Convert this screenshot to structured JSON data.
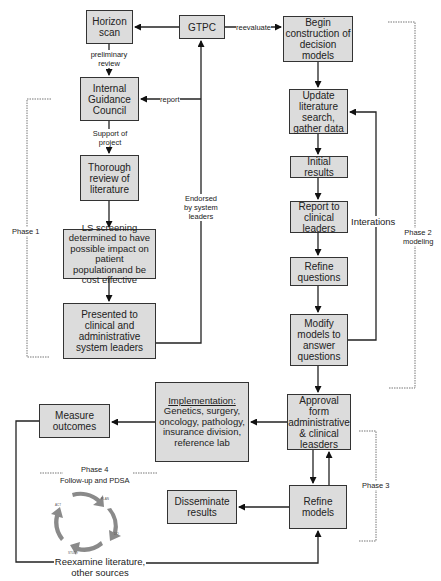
{
  "diagram": {
    "boxes": {
      "horizon_scan": "Horizon scan",
      "gtpc": "GTPC",
      "begin_construction": "Begin construction of decision models",
      "internal_guidance": "Internal Guidance Council",
      "thorough_review": "Thorough review of literature",
      "ls_screening": "LS screening determined to have possible impact on patient populationand be cost effective",
      "presented": "Presented to clinical and administrative system leaders",
      "update_literature": "Update literature search, gather data",
      "initial_results": "Initial results",
      "report_clinical": "Report to clinical leaders",
      "refine_questions": "Refine questions",
      "modify_models": "Modify models to answer questions",
      "approval": "Approval form administrative & clinical leasders",
      "implementation_title": "Implementation:",
      "implementation_body": "Genetics, surgery, oncology, pathology, insurance division, reference lab",
      "measure_outcomes": "Measure outcomes",
      "disseminate": "Disseminate results",
      "refine_models": "Refine models"
    },
    "edge_labels": {
      "preliminary_review": "preliminary review",
      "report": "report",
      "reevaluate": "reevaluate",
      "support_of_project": "Support of project",
      "endorsed": "Endorsed by system leaders",
      "interations": "Interations",
      "reexamine": "Reexamine literature, other sources"
    },
    "phases": {
      "phase1": "Phase 1",
      "phase2": "Phase 2 modeling",
      "phase3": "Phase 3",
      "phase4_title": "Phase 4",
      "phase4_sub": "Follow-up and PDSA"
    },
    "pdsa_cycle": {
      "segments": [
        "PLAN",
        "DO",
        "STUDY",
        "ACT"
      ]
    },
    "colors": {
      "box_fill": "#dcdcdc",
      "box_border": "#333333",
      "line": "#222222",
      "phase_bracket": "#777777"
    }
  }
}
